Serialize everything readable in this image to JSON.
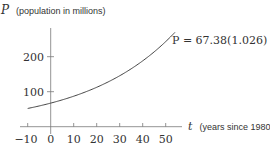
{
  "chart_data": {
    "type": "line",
    "title": "",
    "ylabel_var": "P",
    "ylabel_desc": "(population in millions)",
    "xlabel_var": "t",
    "xlabel_desc": "(years since 1980)",
    "equation": {
      "lhs": "P = 67.38(1.026)",
      "exponent": "t"
    },
    "function": "67.38*1.026^t",
    "x_ticks": [
      "−10",
      "0",
      "10",
      "20",
      "30",
      "40",
      "50"
    ],
    "y_ticks": [
      "100",
      "200"
    ],
    "xlim": [
      -10,
      57
    ],
    "ylim": [
      0,
      280
    ],
    "grid": false,
    "series": [
      {
        "name": "P = 67.38(1.026)^t",
        "x": [
          -10,
          0,
          10,
          20,
          30,
          40,
          50,
          54
        ],
        "y": [
          52.1,
          67.4,
          87.1,
          112.5,
          145.5,
          188.1,
          243.1,
          269.4
        ]
      }
    ]
  }
}
